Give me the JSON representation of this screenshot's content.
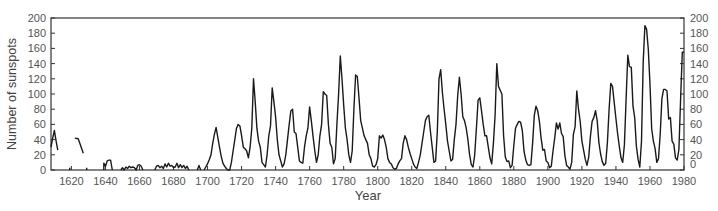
{
  "chart_data": {
    "type": "line",
    "title": "",
    "xlabel": "Year",
    "ylabel": "Number of sunspots",
    "xlim": [
      1608,
      1980
    ],
    "ylim": [
      0,
      200
    ],
    "grid": false,
    "legend": null,
    "right_axis_duplicate": true,
    "x_ticks": [
      1620,
      1640,
      1660,
      1680,
      1700,
      1720,
      1740,
      1760,
      1780,
      1800,
      1820,
      1840,
      1860,
      1880,
      1900,
      1920,
      1940,
      1960,
      1980
    ],
    "y_ticks": [
      0,
      20,
      40,
      60,
      80,
      100,
      120,
      140,
      160,
      180,
      200
    ],
    "line_color": "#1a1a1a",
    "segments": [
      [
        [
          1608,
          30
        ],
        [
          1609,
          42
        ],
        [
          1610,
          52
        ],
        [
          1611,
          38
        ],
        [
          1612,
          26
        ]
      ],
      [
        [
          1622,
          42
        ],
        [
          1624,
          41
        ],
        [
          1625,
          35
        ],
        [
          1627,
          22
        ]
      ],
      [
        [
          1619,
          0
        ],
        [
          1619,
          3
        ]
      ],
      [
        [
          1629,
          0
        ],
        [
          1629,
          3
        ]
      ],
      [
        [
          1639,
          0
        ],
        [
          1639,
          9
        ],
        [
          1640,
          5
        ],
        [
          1641,
          12
        ],
        [
          1642,
          13
        ],
        [
          1643,
          13
        ],
        [
          1644,
          0
        ]
      ],
      [
        [
          1649,
          0
        ],
        [
          1650,
          3
        ],
        [
          1651,
          0
        ],
        [
          1652,
          4
        ],
        [
          1653,
          2
        ],
        [
          1654,
          5
        ],
        [
          1655,
          3
        ],
        [
          1656,
          4
        ],
        [
          1657,
          3
        ],
        [
          1658,
          0
        ],
        [
          1659,
          6
        ],
        [
          1660,
          7
        ],
        [
          1661,
          5
        ],
        [
          1662,
          0
        ]
      ],
      [
        [
          1669,
          0
        ],
        [
          1670,
          5
        ],
        [
          1671,
          6
        ],
        [
          1672,
          3
        ],
        [
          1673,
          5
        ],
        [
          1674,
          2
        ],
        [
          1675,
          8
        ],
        [
          1676,
          4
        ],
        [
          1677,
          9
        ],
        [
          1678,
          5
        ],
        [
          1679,
          6
        ],
        [
          1680,
          3
        ],
        [
          1681,
          4
        ],
        [
          1682,
          9
        ],
        [
          1683,
          3
        ],
        [
          1684,
          7
        ],
        [
          1685,
          3
        ],
        [
          1686,
          6
        ],
        [
          1687,
          2
        ],
        [
          1688,
          5
        ],
        [
          1689,
          0
        ]
      ],
      [
        [
          1694,
          0
        ],
        [
          1695,
          6
        ],
        [
          1696,
          0
        ]
      ],
      [
        [
          1698,
          0
        ],
        [
          1700,
          8
        ],
        [
          1701,
          14
        ],
        [
          1702,
          20
        ],
        [
          1703,
          35
        ],
        [
          1704,
          47
        ],
        [
          1705,
          56
        ],
        [
          1706,
          43
        ],
        [
          1707,
          30
        ],
        [
          1708,
          18
        ],
        [
          1709,
          9
        ],
        [
          1710,
          5
        ],
        [
          1711,
          2
        ],
        [
          1712,
          0
        ],
        [
          1713,
          0
        ],
        [
          1714,
          10
        ],
        [
          1715,
          25
        ],
        [
          1716,
          40
        ],
        [
          1717,
          55
        ],
        [
          1718,
          60
        ],
        [
          1719,
          58
        ],
        [
          1720,
          45
        ],
        [
          1721,
          30
        ],
        [
          1722,
          28
        ],
        [
          1723,
          25
        ],
        [
          1724,
          16
        ],
        [
          1725,
          30
        ],
        [
          1726,
          55
        ],
        [
          1727,
          120
        ],
        [
          1728,
          90
        ],
        [
          1729,
          55
        ],
        [
          1730,
          38
        ],
        [
          1731,
          30
        ],
        [
          1732,
          10
        ],
        [
          1733,
          7
        ],
        [
          1734,
          4
        ],
        [
          1735,
          20
        ],
        [
          1736,
          45
        ],
        [
          1737,
          58
        ],
        [
          1738,
          108
        ],
        [
          1739,
          90
        ],
        [
          1740,
          70
        ],
        [
          1741,
          40
        ],
        [
          1742,
          20
        ],
        [
          1743,
          12
        ],
        [
          1744,
          4
        ],
        [
          1745,
          8
        ],
        [
          1746,
          20
        ],
        [
          1747,
          40
        ],
        [
          1748,
          60
        ],
        [
          1749,
          78
        ],
        [
          1750,
          80
        ],
        [
          1751,
          50
        ],
        [
          1752,
          48
        ],
        [
          1753,
          30
        ],
        [
          1754,
          12
        ],
        [
          1755,
          10
        ],
        [
          1756,
          9
        ],
        [
          1757,
          30
        ],
        [
          1758,
          45
        ],
        [
          1759,
          55
        ],
        [
          1760,
          83
        ],
        [
          1761,
          65
        ],
        [
          1762,
          45
        ],
        [
          1763,
          25
        ],
        [
          1764,
          10
        ],
        [
          1765,
          20
        ],
        [
          1766,
          45
        ],
        [
          1767,
          60
        ],
        [
          1768,
          103
        ],
        [
          1769,
          100
        ],
        [
          1770,
          98
        ],
        [
          1771,
          60
        ],
        [
          1772,
          35
        ],
        [
          1773,
          30
        ],
        [
          1774,
          8
        ],
        [
          1775,
          15
        ],
        [
          1776,
          60
        ],
        [
          1777,
          100
        ],
        [
          1778,
          150
        ],
        [
          1779,
          120
        ],
        [
          1780,
          85
        ],
        [
          1781,
          55
        ],
        [
          1782,
          40
        ],
        [
          1783,
          20
        ],
        [
          1784,
          10
        ],
        [
          1785,
          25
        ],
        [
          1786,
          80
        ],
        [
          1787,
          125
        ],
        [
          1788,
          123
        ],
        [
          1789,
          95
        ],
        [
          1790,
          65
        ],
        [
          1791,
          55
        ],
        [
          1792,
          45
        ],
        [
          1793,
          40
        ],
        [
          1794,
          35
        ],
        [
          1795,
          20
        ],
        [
          1796,
          15
        ],
        [
          1797,
          5
        ],
        [
          1798,
          4
        ],
        [
          1799,
          7
        ],
        [
          1800,
          15
        ],
        [
          1801,
          45
        ],
        [
          1802,
          42
        ],
        [
          1803,
          46
        ],
        [
          1804,
          40
        ],
        [
          1805,
          30
        ],
        [
          1806,
          15
        ],
        [
          1807,
          10
        ],
        [
          1808,
          8
        ],
        [
          1809,
          3
        ],
        [
          1810,
          1
        ],
        [
          1811,
          2
        ],
        [
          1812,
          8
        ],
        [
          1813,
          12
        ],
        [
          1814,
          15
        ],
        [
          1815,
          35
        ],
        [
          1816,
          45
        ],
        [
          1817,
          40
        ],
        [
          1818,
          30
        ],
        [
          1819,
          22
        ],
        [
          1820,
          15
        ],
        [
          1821,
          8
        ],
        [
          1822,
          4
        ],
        [
          1823,
          2
        ],
        [
          1824,
          10
        ],
        [
          1825,
          20
        ],
        [
          1826,
          35
        ],
        [
          1827,
          50
        ],
        [
          1828,
          65
        ],
        [
          1829,
          70
        ],
        [
          1830,
          72
        ],
        [
          1831,
          50
        ],
        [
          1832,
          30
        ],
        [
          1833,
          10
        ],
        [
          1834,
          12
        ],
        [
          1835,
          50
        ],
        [
          1836,
          120
        ],
        [
          1837,
          132
        ],
        [
          1838,
          102
        ],
        [
          1839,
          80
        ],
        [
          1840,
          60
        ],
        [
          1841,
          38
        ],
        [
          1842,
          25
        ],
        [
          1843,
          12
        ],
        [
          1844,
          14
        ],
        [
          1845,
          40
        ],
        [
          1846,
          60
        ],
        [
          1847,
          98
        ],
        [
          1848,
          122
        ],
        [
          1849,
          100
        ],
        [
          1850,
          70
        ],
        [
          1851,
          65
        ],
        [
          1852,
          55
        ],
        [
          1853,
          40
        ],
        [
          1854,
          20
        ],
        [
          1855,
          7
        ],
        [
          1856,
          4
        ],
        [
          1857,
          20
        ],
        [
          1858,
          55
        ],
        [
          1859,
          92
        ],
        [
          1860,
          95
        ],
        [
          1861,
          78
        ],
        [
          1862,
          60
        ],
        [
          1863,
          45
        ],
        [
          1864,
          45
        ],
        [
          1865,
          30
        ],
        [
          1866,
          16
        ],
        [
          1867,
          8
        ],
        [
          1868,
          35
        ],
        [
          1869,
          72
        ],
        [
          1870,
          140
        ],
        [
          1871,
          110
        ],
        [
          1872,
          105
        ],
        [
          1873,
          100
        ],
        [
          1874,
          45
        ],
        [
          1875,
          17
        ],
        [
          1876,
          11
        ],
        [
          1877,
          12
        ],
        [
          1878,
          3
        ],
        [
          1879,
          6
        ],
        [
          1880,
          32
        ],
        [
          1881,
          55
        ],
        [
          1882,
          60
        ],
        [
          1883,
          64
        ],
        [
          1884,
          63
        ],
        [
          1885,
          52
        ],
        [
          1886,
          25
        ],
        [
          1887,
          13
        ],
        [
          1888,
          7
        ],
        [
          1889,
          6
        ],
        [
          1890,
          7
        ],
        [
          1891,
          35
        ],
        [
          1892,
          72
        ],
        [
          1893,
          84
        ],
        [
          1894,
          78
        ],
        [
          1895,
          64
        ],
        [
          1896,
          42
        ],
        [
          1897,
          26
        ],
        [
          1898,
          27
        ],
        [
          1899,
          12
        ],
        [
          1900,
          10
        ],
        [
          1901,
          3
        ],
        [
          1902,
          5
        ],
        [
          1903,
          25
        ],
        [
          1904,
          42
        ],
        [
          1905,
          62
        ],
        [
          1906,
          54
        ],
        [
          1907,
          62
        ],
        [
          1908,
          48
        ],
        [
          1909,
          44
        ],
        [
          1910,
          19
        ],
        [
          1911,
          6
        ],
        [
          1912,
          4
        ],
        [
          1913,
          1
        ],
        [
          1914,
          10
        ],
        [
          1915,
          47
        ],
        [
          1916,
          57
        ],
        [
          1917,
          104
        ],
        [
          1918,
          80
        ],
        [
          1919,
          64
        ],
        [
          1920,
          38
        ],
        [
          1921,
          26
        ],
        [
          1922,
          14
        ],
        [
          1923,
          6
        ],
        [
          1924,
          17
        ],
        [
          1925,
          44
        ],
        [
          1926,
          64
        ],
        [
          1927,
          69
        ],
        [
          1928,
          78
        ],
        [
          1929,
          65
        ],
        [
          1930,
          36
        ],
        [
          1931,
          21
        ],
        [
          1932,
          11
        ],
        [
          1933,
          6
        ],
        [
          1934,
          9
        ],
        [
          1935,
          36
        ],
        [
          1936,
          80
        ],
        [
          1937,
          114
        ],
        [
          1938,
          110
        ],
        [
          1939,
          89
        ],
        [
          1940,
          68
        ],
        [
          1941,
          48
        ],
        [
          1942,
          31
        ],
        [
          1943,
          16
        ],
        [
          1944,
          10
        ],
        [
          1945,
          33
        ],
        [
          1946,
          93
        ],
        [
          1947,
          151
        ],
        [
          1948,
          136
        ],
        [
          1949,
          135
        ],
        [
          1950,
          84
        ],
        [
          1951,
          69
        ],
        [
          1952,
          31
        ],
        [
          1953,
          14
        ],
        [
          1954,
          4
        ],
        [
          1955,
          38
        ],
        [
          1956,
          142
        ],
        [
          1957,
          190
        ],
        [
          1958,
          185
        ],
        [
          1959,
          159
        ],
        [
          1960,
          112
        ],
        [
          1961,
          54
        ],
        [
          1962,
          38
        ],
        [
          1963,
          28
        ],
        [
          1964,
          10
        ],
        [
          1965,
          15
        ],
        [
          1966,
          47
        ],
        [
          1967,
          94
        ],
        [
          1968,
          106
        ],
        [
          1969,
          106
        ],
        [
          1970,
          104
        ],
        [
          1971,
          67
        ],
        [
          1972,
          69
        ],
        [
          1973,
          38
        ],
        [
          1974,
          34
        ],
        [
          1975,
          16
        ],
        [
          1976,
          13
        ],
        [
          1977,
          27
        ],
        [
          1978,
          93
        ],
        [
          1979,
          155
        ],
        [
          1980,
          155
        ]
      ]
    ]
  },
  "axes": {
    "ylabel": "Number of sunspots",
    "xlabel": "Year",
    "x_tick_labels": [
      "1620",
      "1640",
      "1660",
      "1680",
      "1700",
      "1720",
      "1740",
      "1760",
      "1780",
      "1800",
      "1820",
      "1840",
      "1860",
      "1880",
      "1900",
      "1920",
      "1940",
      "1960",
      "1980"
    ],
    "y_tick_labels": [
      "0",
      "20",
      "40",
      "60",
      "80",
      "100",
      "120",
      "140",
      "160",
      "180",
      "200"
    ]
  }
}
